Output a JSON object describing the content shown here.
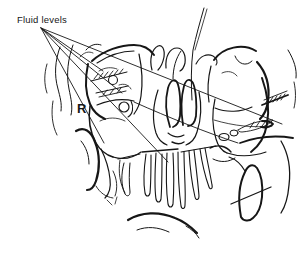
{
  "figure": {
    "annotation_label": "Fluid levels",
    "orientation_marker": "R",
    "ink_color": "#161616",
    "background_color": "#ffffff"
  }
}
